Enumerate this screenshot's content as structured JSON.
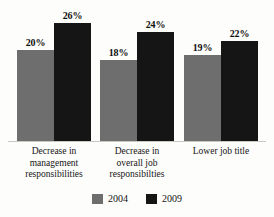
{
  "chart_data": {
    "type": "bar",
    "title": "",
    "subtitle": "",
    "xlabel": "",
    "ylabel": "",
    "ylim": [
      0,
      30
    ],
    "grid": false,
    "legend_position": "bottom-center",
    "value_suffix": "%",
    "categories": [
      "Decrease in management responsibilities",
      "Decrease in overall job responsibilties",
      "Lower job title"
    ],
    "category_lines": [
      [
        "Decrease in",
        "management",
        "responsibilities"
      ],
      [
        "Decrease in",
        "overall job",
        "responsibilties"
      ],
      [
        "Lower job title"
      ]
    ],
    "series": [
      {
        "name": "2004",
        "color": "#6e6e6e",
        "values": [
          20,
          18,
          19
        ],
        "labels": [
          "20%",
          "18%",
          "19%"
        ]
      },
      {
        "name": "2009",
        "color": "#151515",
        "values": [
          26,
          24,
          22
        ],
        "labels": [
          "26%",
          "24%",
          "22%"
        ]
      }
    ]
  },
  "legend": {
    "items": [
      {
        "label": "2004",
        "color": "#6e6e6e"
      },
      {
        "label": "2009",
        "color": "#151515"
      }
    ]
  },
  "colors": {
    "background": "#fdfdfb",
    "axis": "#c9c9c4",
    "text": "#151515",
    "series_2004": "#6e6e6e",
    "series_2009": "#151515"
  }
}
